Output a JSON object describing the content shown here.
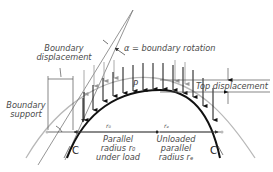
{
  "labels": {
    "boundary_displacement_line1": "Boundary",
    "boundary_displacement_line2": "displacement",
    "alpha": "α = boundary rotation",
    "top_displacement": "Top displacement",
    "boundary_support_line1": "Boundary",
    "boundary_support_line2": "support",
    "load": "P",
    "r0_left": "r₀",
    "r0_right": "rₑ",
    "loaded_line1": "Parallel",
    "loaded_line2": "radius r₀",
    "loaded_line3": "under load",
    "unloaded_line1": "Unloaded",
    "unloaded_line2": "parallel",
    "unloaded_line3": "radius rₑ",
    "c_left": "C",
    "c_right": "C"
  },
  "colors": {
    "loaded_curve": "#111111",
    "unloaded_curve": "#b5b5b5",
    "text": "#4a4a4a",
    "guide_lines": "#8a8a8a"
  }
}
